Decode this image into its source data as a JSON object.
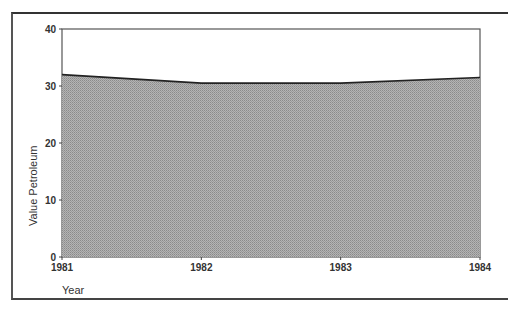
{
  "chart_data": {
    "type": "area",
    "title": "",
    "xlabel": "Year",
    "ylabel": "Value Petroleum",
    "categories": [
      "1981",
      "1982",
      "1983",
      "1984"
    ],
    "series": [
      {
        "name": "Value Petroleum",
        "values": [
          32.0,
          30.5,
          30.5,
          31.5
        ]
      }
    ],
    "ylim": [
      0,
      40
    ],
    "yticks": [
      "0",
      "10",
      "20",
      "30",
      "40"
    ],
    "grid": false,
    "legend": null,
    "fill_color": "#a8a8a8",
    "line_color": "#222222"
  }
}
